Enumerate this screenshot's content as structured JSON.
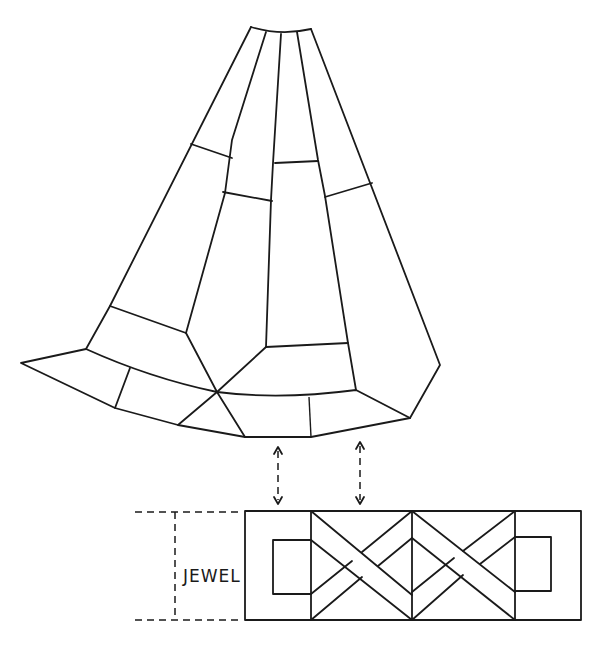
{
  "figure": {
    "label": "JEWEL",
    "colors": {
      "line": "#1a1a1a",
      "background": "#ffffff"
    }
  }
}
